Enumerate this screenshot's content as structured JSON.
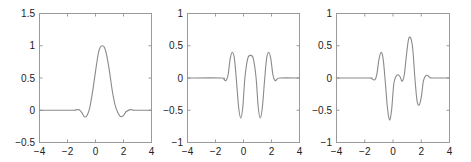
{
  "chart_data": [
    {
      "type": "line",
      "title": "",
      "xlabel": "",
      "ylabel": "",
      "xlim": [
        -4,
        4
      ],
      "ylim": [
        -0.5,
        1.5
      ],
      "xticks": [
        -4,
        -2,
        0,
        2,
        4
      ],
      "xtick_labels": [
        "−4",
        "−2",
        "0",
        "2",
        "4"
      ],
      "yticks": [
        -0.5,
        0,
        0.5,
        1,
        1.5
      ],
      "ytick_labels": [
        "−0.5",
        "0",
        "0.5",
        "1",
        "1.5"
      ],
      "grid": false,
      "series": [
        {
          "name": "curve",
          "x": [
            -4,
            -1.8,
            -1.5,
            -1.2,
            -1.0,
            -0.8,
            -0.6,
            -0.4,
            -0.2,
            0.0,
            0.2,
            0.35,
            0.5,
            0.65,
            0.8,
            1.0,
            1.2,
            1.4,
            1.6,
            1.8,
            2.0,
            2.2,
            2.5,
            2.8,
            4
          ],
          "y": [
            0,
            0,
            0.0,
            0.01,
            -0.03,
            -0.1,
            -0.08,
            0.05,
            0.3,
            0.6,
            0.88,
            0.98,
            1.0,
            0.97,
            0.85,
            0.6,
            0.3,
            0.08,
            -0.04,
            -0.1,
            -0.08,
            -0.02,
            0.01,
            0,
            0
          ]
        }
      ]
    },
    {
      "type": "line",
      "title": "",
      "xlabel": "",
      "ylabel": "",
      "xlim": [
        -4,
        4
      ],
      "ylim": [
        -1,
        1
      ],
      "xticks": [
        -4,
        -2,
        0,
        2,
        4
      ],
      "xtick_labels": [
        "−4",
        "−2",
        "0",
        "2",
        "4"
      ],
      "yticks": [
        -1,
        -0.5,
        0,
        0.5,
        1
      ],
      "ytick_labels": [
        "−1",
        "−0.5",
        "0",
        "0.5",
        "1"
      ],
      "grid": false,
      "series": [
        {
          "name": "curve",
          "x": [
            -4,
            -1.6,
            -1.4,
            -1.25,
            -1.1,
            -0.95,
            -0.8,
            -0.65,
            -0.5,
            -0.35,
            -0.2,
            -0.05,
            0.1,
            0.3,
            0.5,
            0.7,
            0.9,
            1.05,
            1.2,
            1.35,
            1.5,
            1.65,
            1.8,
            1.95,
            2.1,
            2.25,
            2.4,
            2.6,
            4
          ],
          "y": [
            0,
            0,
            -0.02,
            -0.04,
            0.05,
            0.3,
            0.4,
            0.3,
            -0.05,
            -0.45,
            -0.62,
            -0.45,
            0.0,
            0.3,
            0.35,
            0.3,
            0.0,
            -0.45,
            -0.62,
            -0.45,
            -0.05,
            0.3,
            0.4,
            0.3,
            0.05,
            -0.04,
            -0.02,
            0,
            0
          ]
        }
      ]
    },
    {
      "type": "line",
      "title": "",
      "xlabel": "",
      "ylabel": "",
      "xlim": [
        -4,
        4
      ],
      "ylim": [
        -1,
        1
      ],
      "xticks": [
        -4,
        -2,
        0,
        2,
        4
      ],
      "xtick_labels": [
        "−4",
        "−2",
        "0",
        "2",
        "4"
      ],
      "yticks": [
        -1,
        -0.5,
        0,
        0.5,
        1
      ],
      "ytick_labels": [
        "−1",
        "−0.5",
        "0",
        "0.5",
        "1"
      ],
      "grid": false,
      "series": [
        {
          "name": "curve",
          "x": [
            -4,
            -1.7,
            -1.5,
            -1.3,
            -1.15,
            -1.0,
            -0.85,
            -0.7,
            -0.55,
            -0.4,
            -0.25,
            -0.1,
            0.05,
            0.2,
            0.35,
            0.5,
            0.65,
            0.8,
            0.95,
            1.1,
            1.25,
            1.4,
            1.55,
            1.7,
            1.85,
            2.0,
            2.15,
            2.3,
            2.45,
            2.6,
            2.8,
            4
          ],
          "y": [
            0,
            0,
            -0.01,
            -0.03,
            0.05,
            0.28,
            0.4,
            0.3,
            -0.05,
            -0.45,
            -0.65,
            -0.5,
            -0.1,
            0.02,
            0.05,
            0.02,
            -0.05,
            0.05,
            0.35,
            0.6,
            0.62,
            0.45,
            0.0,
            -0.35,
            -0.42,
            -0.3,
            -0.05,
            0.03,
            0.04,
            0.01,
            0,
            0
          ]
        }
      ]
    }
  ],
  "colors": {
    "line": "#8a8a8a",
    "axes": "#9a9a9a",
    "text": "#222222"
  }
}
